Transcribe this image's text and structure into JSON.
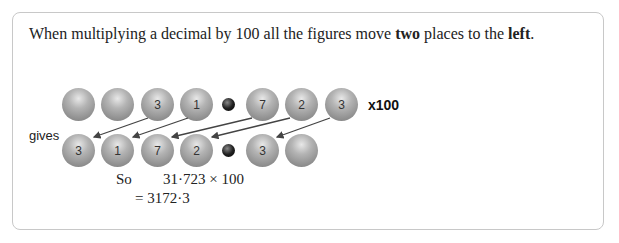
{
  "intro": {
    "part1": "When multiplying a decimal by 100 all the figures move ",
    "bold1": "two",
    "part2": " places to the ",
    "bold2": "left",
    "part3": "."
  },
  "row1": {
    "balls": [
      "",
      "",
      "3",
      "1",
      "7",
      "2",
      "3"
    ],
    "multiplier": "x100"
  },
  "row2": {
    "label": "gives",
    "balls": [
      "3",
      "1",
      "7",
      "2",
      "3",
      ""
    ]
  },
  "working": {
    "so_label": "So",
    "expression": "31·723 × 100",
    "result": "= 3172·3"
  }
}
